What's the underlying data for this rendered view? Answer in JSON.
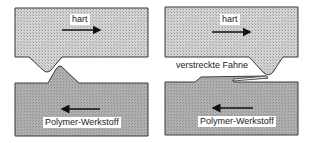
{
  "figure": {
    "left_panel": {
      "top_label": "hart",
      "bottom_label": "Polymer-Werkstoff",
      "top_arrow_direction": "right",
      "bottom_arrow_direction": "left"
    },
    "right_panel": {
      "top_label": "hart",
      "bottom_label": "Polymer-Werkstoff",
      "flag_label": "verstreckte Fahne",
      "top_arrow_direction": "right",
      "bottom_arrow_direction": "left"
    },
    "colors": {
      "hard_fill": "#c8c8c8",
      "polymer_fill": "#a9a9a9",
      "outline": "#3a3a3a",
      "arrow": "#111111"
    }
  }
}
